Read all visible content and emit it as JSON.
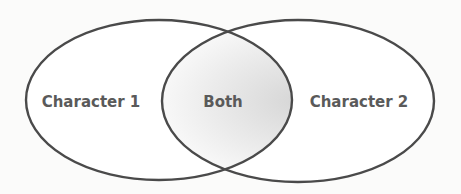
{
  "diagram": {
    "type": "venn",
    "sets": [
      {
        "label": "Character 1",
        "cx": 159,
        "cy": 100,
        "rx": 133,
        "ry": 80
      },
      {
        "label": "Character 2",
        "cx": 298,
        "cy": 101,
        "rx": 136,
        "ry": 81
      }
    ],
    "overlap_label": "Both",
    "colors": {
      "stroke": "#4a4a4a",
      "fill": "#ffffff",
      "overlap_shade": "#d9d9d9",
      "text": "#5a5a5a",
      "background": "#fbfbfa"
    }
  }
}
